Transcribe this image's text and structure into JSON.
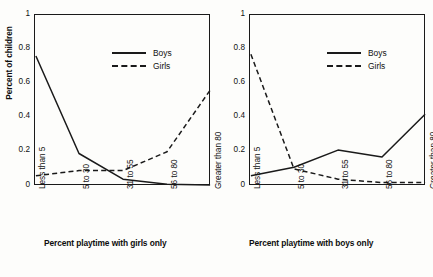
{
  "chart_data": [
    {
      "type": "line",
      "id": "playtime-with-girls",
      "title": "",
      "xlabel": "Percent playtime with girls only",
      "ylabel": "Percent of children",
      "categories": [
        "Less than 5",
        "5 to 30",
        "31 to 55",
        "56 to 80",
        "Greater than 80"
      ],
      "ylim": [
        0,
        1
      ],
      "yticks": [
        "0",
        "0.2",
        "0.4",
        "0.6",
        "0.8",
        "1"
      ],
      "ytick_values": [
        0,
        0.2,
        0.4,
        0.6,
        0.8,
        1
      ],
      "grid": false,
      "legend_position": "top-right",
      "series": [
        {
          "name": "Boys",
          "style": "solid",
          "values": [
            0.76,
            0.19,
            0.04,
            0.01,
            0.0
          ]
        },
        {
          "name": "Girls",
          "style": "dashed",
          "values": [
            0.06,
            0.09,
            0.09,
            0.2,
            0.56
          ]
        }
      ]
    },
    {
      "type": "line",
      "id": "playtime-with-boys",
      "title": "",
      "xlabel": "Percent playtime with boys only",
      "ylabel": "",
      "categories": [
        "Less than 5",
        "5 to 30",
        "31 to 55",
        "56 to 80",
        "Greater than 80"
      ],
      "ylim": [
        0,
        1
      ],
      "yticks": [
        "0",
        "0.2",
        "0.4",
        "0.6",
        "0.8",
        "1"
      ],
      "ytick_values": [
        0,
        0.2,
        0.4,
        0.6,
        0.8,
        1
      ],
      "grid": false,
      "legend_position": "top-right",
      "series": [
        {
          "name": "Boys",
          "style": "solid",
          "values": [
            0.06,
            0.11,
            0.21,
            0.17,
            0.42
          ]
        },
        {
          "name": "Girls",
          "style": "dashed",
          "values": [
            0.77,
            0.1,
            0.04,
            0.02,
            0.02
          ]
        }
      ]
    }
  ]
}
